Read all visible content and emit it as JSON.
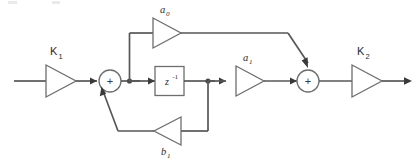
{
  "diagram": {
    "type": "block-diagram",
    "colors": {
      "wire": "#575757",
      "shape_stroke": "#6e6e6e",
      "background": "#ffffff",
      "text": "#2b2b2b"
    },
    "blocks": {
      "input_gain": {
        "label": "K",
        "subscript": "1",
        "name": "K1"
      },
      "output_gain": {
        "label": "K",
        "subscript": "2",
        "name": "K2"
      },
      "feedforward_gain_a0": {
        "label": "a",
        "subscript": "0",
        "name": "a0"
      },
      "feedforward_gain_a1": {
        "label": "a",
        "subscript": "1",
        "name": "a1"
      },
      "feedback_gain_b1": {
        "label": "b",
        "subscript": "1",
        "name": "b1"
      },
      "delay": {
        "label": "z",
        "superscript": "-1",
        "name": "z^-1"
      },
      "sum_left": {
        "sign": "+",
        "name": "summing-junction-1"
      },
      "sum_right": {
        "sign": "+",
        "name": "summing-junction-2"
      }
    }
  }
}
